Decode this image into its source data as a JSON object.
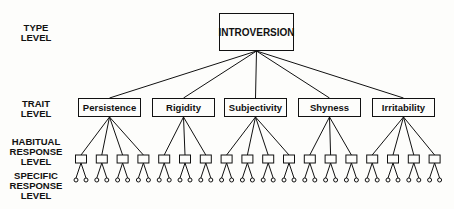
{
  "levels": {
    "type": [
      "TYPE",
      "LEVEL"
    ],
    "trait": [
      "TRAIT",
      "LEVEL"
    ],
    "habitual": [
      "HABITUAL",
      "RESPONSE",
      "LEVEL"
    ],
    "specific": [
      "SPECIFIC",
      "RESPONSE",
      "LEVEL"
    ]
  },
  "type_node": {
    "label": "INTROVERSION"
  },
  "traits": [
    {
      "label": "Persistence",
      "habitual_count": 4
    },
    {
      "label": "Rigidity",
      "habitual_count": 3
    },
    {
      "label": "Subjectivity",
      "habitual_count": 4
    },
    {
      "label": "Shyness",
      "habitual_count": 3
    },
    {
      "label": "Irritability",
      "habitual_count": 4
    }
  ],
  "specific_per_habitual": 2,
  "colors": {
    "line": "#111111",
    "background": "#fdfdfb"
  }
}
